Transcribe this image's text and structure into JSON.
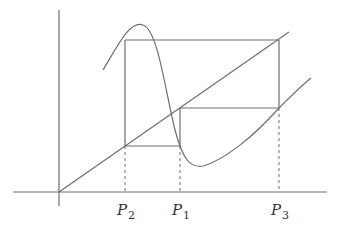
{
  "diagram": {
    "type": "cobweb-period-3-orbit",
    "colors": {
      "stroke": "#6e6e6e",
      "text": "#333333",
      "background": "#ffffff"
    },
    "axes": {
      "origin": [
        59,
        192
      ],
      "x_axis": {
        "from": [
          13,
          192
        ],
        "to": [
          327,
          192
        ]
      },
      "y_axis": {
        "from": [
          59,
          10
        ],
        "to": [
          59,
          206
        ]
      }
    },
    "diagonal": {
      "from": [
        59,
        192
      ],
      "to": [
        289,
        32
      ]
    },
    "curve_path": "M 103 70 C 118 45, 130 20, 143 25 C 158 30, 165 90, 175 130 C 183 160, 190 168, 203 166 C 225 160, 255 135, 279 108 C 290 97, 300 87, 311 78",
    "points": [
      {
        "name": "P",
        "sub": "2",
        "x": 125
      },
      {
        "name": "P",
        "sub": "1",
        "x": 180
      },
      {
        "name": "P",
        "sub": "3",
        "x": 279
      }
    ],
    "cobweb": {
      "top_y": 40,
      "middle_y": 108,
      "lower_y": 146
    },
    "labels": {
      "p2": {
        "main": "P",
        "sub": "2"
      },
      "p1": {
        "main": "P",
        "sub": "1"
      },
      "p3": {
        "main": "P",
        "sub": "3"
      }
    }
  }
}
